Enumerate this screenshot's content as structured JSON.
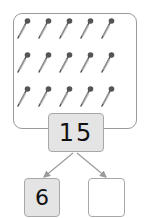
{
  "picture": {
    "item_icon": "pen-icon",
    "item_count": 15,
    "rows": 3,
    "columns": 5
  },
  "number_bond": {
    "whole": "15",
    "parts": [
      "6",
      ""
    ]
  },
  "colors": {
    "box_fill": "#e4e4e4",
    "box_border": "#a8a8a8",
    "item_color": "#555555",
    "arrow_color": "#9a9a9a"
  }
}
